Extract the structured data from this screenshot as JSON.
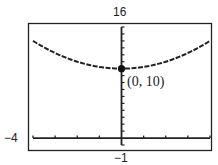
{
  "chart_data": {
    "type": "line",
    "title": "",
    "xlabel": "",
    "ylabel": "",
    "function": "y = 10 + x^2/4",
    "xlim": [
      -4,
      4
    ],
    "ylim": [
      -1,
      16
    ],
    "x_tick_step": 1,
    "y_tick_step": 1,
    "grid": false,
    "window_labels": {
      "xmin": "−4",
      "ymax": "16",
      "ymin": "−1"
    },
    "series": [
      {
        "name": "curve",
        "x": [
          -4,
          -3,
          -2,
          -1,
          0,
          1,
          2,
          3,
          4
        ],
        "values": [
          14,
          12.25,
          11,
          10.25,
          10,
          10.25,
          11,
          12.25,
          14
        ]
      }
    ],
    "annotations": [
      {
        "x": 0,
        "y": 10,
        "label": "(0, 10)",
        "marker": "filled-circle"
      }
    ]
  },
  "colors": {
    "line": "#222222",
    "frame": "#222222",
    "background": "#ffffff"
  }
}
